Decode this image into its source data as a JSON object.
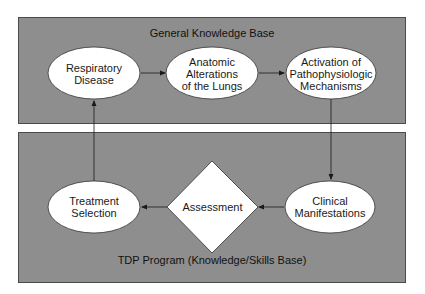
{
  "diagram": {
    "panels": {
      "top": {
        "title": "General Knowledge Base"
      },
      "bottom": {
        "title": "TDP Program (Knowledge/Skills Base)"
      }
    },
    "nodes": [
      {
        "id": "respiratory",
        "shape": "ellipse",
        "label": "Respiratory\nDisease"
      },
      {
        "id": "anatomic",
        "shape": "ellipse",
        "label": "Anatomic\nAlterations\nof the Lungs"
      },
      {
        "id": "activation",
        "shape": "ellipse",
        "label": "Activation of\nPathophysiologic\nMechanisms"
      },
      {
        "id": "clinical",
        "shape": "ellipse",
        "label": "Clinical\nManifestations"
      },
      {
        "id": "assessment",
        "shape": "diamond",
        "label": "Assessment"
      },
      {
        "id": "treatment",
        "shape": "ellipse",
        "label": "Treatment\nSelection"
      }
    ],
    "edges": [
      {
        "from": "respiratory",
        "to": "anatomic"
      },
      {
        "from": "anatomic",
        "to": "activation"
      },
      {
        "from": "activation",
        "to": "clinical"
      },
      {
        "from": "clinical",
        "to": "assessment"
      },
      {
        "from": "assessment",
        "to": "treatment"
      },
      {
        "from": "treatment",
        "to": "respiratory"
      }
    ],
    "colors": {
      "panel_fill": "#8e8e8e",
      "panel_border": "#4a4a4a",
      "node_fill": "#ffffff",
      "line": "#1a1a1a"
    }
  }
}
